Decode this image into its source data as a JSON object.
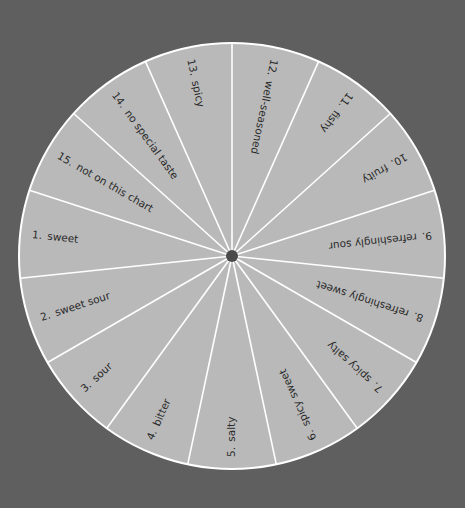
{
  "diagram": {
    "colors": {
      "background": "#5f5f5f",
      "sector_fill": "#b9b9b9",
      "divider": "#ffffff",
      "hub": "#4a4a4a",
      "text": "#2a2a2a"
    },
    "sectors_clockwise_from_top": [
      {
        "number": "12.",
        "label": "well-seasoned"
      },
      {
        "number": "11.",
        "label": "fishy"
      },
      {
        "number": "10.",
        "label": "fruity"
      },
      {
        "number": "9.",
        "label": "refreshingly sour"
      },
      {
        "number": "8.",
        "label": "refreshingly sweet"
      },
      {
        "number": "7.",
        "label": "spicy salty"
      },
      {
        "number": "6.",
        "label": "spicy sweet"
      },
      {
        "number": "5.",
        "label": "salty"
      },
      {
        "number": "4.",
        "label": "bitter"
      },
      {
        "number": "3.",
        "label": "sour"
      },
      {
        "number": "2.",
        "label": "sweet sour"
      },
      {
        "number": "1.",
        "label": "sweet"
      },
      {
        "number": "15.",
        "label": "not on this chart"
      },
      {
        "number": "14.",
        "label": "no special taste"
      },
      {
        "number": "13.",
        "label": "spicy"
      }
    ]
  }
}
